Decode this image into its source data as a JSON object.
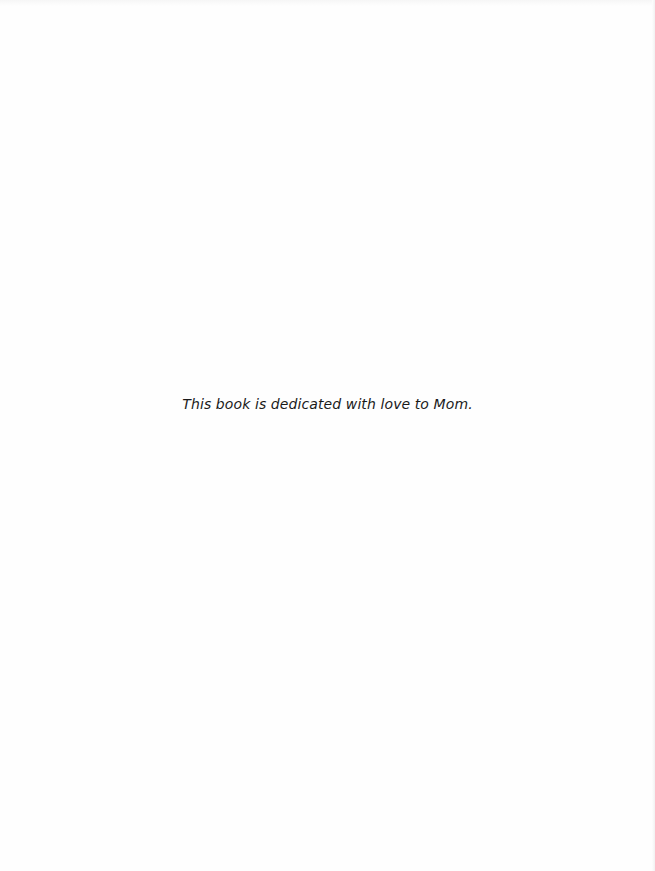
{
  "page": {
    "type": "dedication",
    "dedication_text": "This book is dedicated with love to Mom.",
    "colors": {
      "background": "#fefefe",
      "text": "#1a1a1a"
    }
  }
}
